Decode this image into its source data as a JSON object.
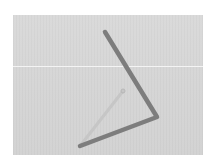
{
  "image": {
    "description": "Grayscale photo of a bent rod forming an angle on a light gray background",
    "background_color": "#d7d7d7",
    "rod_color": "#7d7d7d",
    "faint_line_color": "#c6c6c6",
    "frame": {
      "x": 13,
      "y": 15,
      "width": 190,
      "height": 140
    },
    "rod": {
      "start": {
        "x": 105,
        "y": 32
      },
      "vertex": {
        "x": 157,
        "y": 117
      },
      "end": {
        "x": 80,
        "y": 146
      }
    },
    "faint_line": {
      "from": {
        "x": 80,
        "y": 146
      },
      "to": {
        "x": 123,
        "y": 91
      }
    },
    "pivot_circle": {
      "x": 123,
      "y": 91,
      "r": 2
    }
  }
}
